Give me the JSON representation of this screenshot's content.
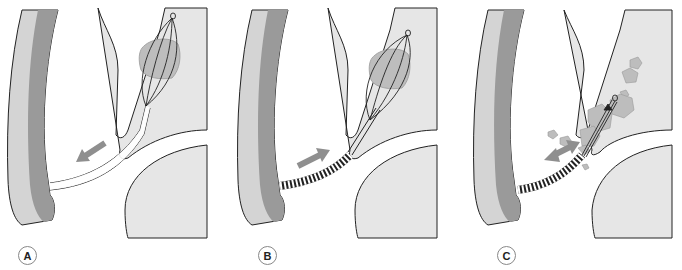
{
  "figure": {
    "colors": {
      "tissue": "#e6e6e6",
      "scope_light": "#d4d4d4",
      "scope_dark": "#9a9a9a",
      "stone": "#bdbdbd",
      "arrow": "#8f8f8f",
      "outline": "#222222"
    },
    "panels": [
      {
        "label": "A",
        "arrow_direction": "out",
        "sheath": "plain",
        "stone_state": "captured"
      },
      {
        "label": "B",
        "arrow_direction": "in",
        "sheath": "metal-coil",
        "stone_state": "captured"
      },
      {
        "label": "C",
        "arrow_direction": "both",
        "sheath": "metal-coil",
        "stone_state": "fragmented"
      }
    ]
  }
}
